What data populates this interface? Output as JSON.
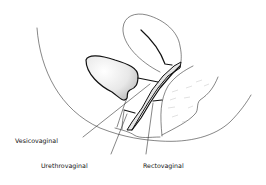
{
  "figure": {
    "labels": {
      "vesicovaginal": "Vesicovaginal",
      "urethrovaginal": "Urethrovaginal",
      "rectovaginal": "Rectovaginal"
    },
    "colors": {
      "ink": "#111111",
      "stipple": "#9a9a9a",
      "background": "#ffffff"
    }
  }
}
